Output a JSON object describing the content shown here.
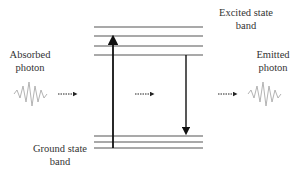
{
  "labels": {
    "excited_line1": "Excited state",
    "excited_line2": "band",
    "absorbed_line1": "Absorbed",
    "absorbed_line2": "photon",
    "emitted_line1": "Emitted",
    "emitted_line2": "photon",
    "ground_line1": "Ground state",
    "ground_line2": "band"
  },
  "colors": {
    "band_line": "#555555",
    "arrow": "#111111",
    "wave": "#aaaaaa"
  }
}
